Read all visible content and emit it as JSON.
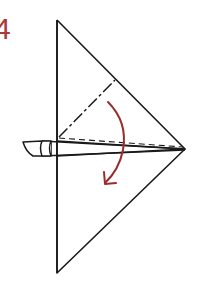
{
  "step": {
    "number": "4"
  },
  "colors": {
    "line": "#1a1a1a",
    "arrow": "#9b2c2c",
    "step_number": "#a83a3a",
    "background": "#ffffff"
  },
  "diagram": {
    "type": "origami-fold-step",
    "elements": [
      {
        "name": "paper-triangle",
        "kind": "outline"
      },
      {
        "name": "mountain-fold-line",
        "kind": "dash-dot"
      },
      {
        "name": "valley-fold-line",
        "kind": "dashed"
      },
      {
        "name": "folded-flap",
        "kind": "outline"
      },
      {
        "name": "fold-direction-arrow",
        "kind": "curved-arrow"
      }
    ]
  }
}
